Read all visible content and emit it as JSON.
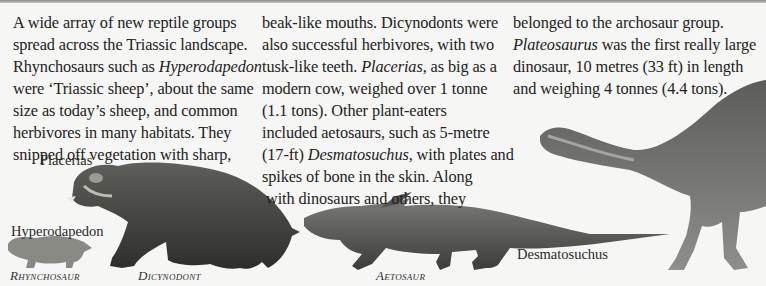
{
  "columns": [
    {
      "lines": [
        {
          "t": "A wide array of new reptile groups"
        },
        {
          "t": "spread across the Triassic landscape."
        },
        {
          "t": "Rhynchosaurs such as ",
          "i": "Hyperodapedon"
        },
        {
          "t": "were ‘Triassic sheep’, about the same"
        },
        {
          "t": "size as today’s sheep, and common"
        },
        {
          "t": "herbivores in many habitats. They"
        },
        {
          "t": "snipped off vegetation with sharp,"
        }
      ]
    },
    {
      "lines": [
        {
          "t": "beak-like mouths. Dicynodonts were"
        },
        {
          "t": "also successful herbivores, with two"
        },
        {
          "t": "tusk-like teeth. ",
          "i": "Placerias",
          "after": ", as big as a"
        },
        {
          "t": "modern cow, weighed over 1 tonne"
        },
        {
          "t": "(1.1 tons). Other plant-eaters"
        },
        {
          "t": "included aetosaurs, such as 5-metre"
        },
        {
          "t": "(17-ft) ",
          "i": "Desmatosuchus",
          "after": ", with plates and"
        },
        {
          "t": "spikes of bone in the skin. Along"
        },
        {
          "t": "with dinosaurs and others, they"
        }
      ]
    },
    {
      "lines": [
        {
          "t": "belonged to the archosaur group."
        },
        {
          "t": "",
          "i": "Plateosaurus",
          "after": " was the first really large"
        },
        {
          "t": "dinosaur, 10 metres (33 ft) in length"
        },
        {
          "t": "and weighing 4 tonnes (4.4 tons)."
        }
      ]
    }
  ],
  "captions": {
    "placerias": "Placerias",
    "hyperodapedon": "Hyperodapedon",
    "desmatosuchus": "Desmatosuchus",
    "rhynchosaur": "Rhynchosaur",
    "dicynodont": "Dicynodont",
    "aetosaur": "Aetosaur"
  },
  "illustrations": [
    {
      "name": "Placerias",
      "group": "Dicynodont"
    },
    {
      "name": "Hyperodapedon",
      "group": "Rhynchosaur"
    },
    {
      "name": "Desmatosuchus",
      "group": "Aetosaur"
    },
    {
      "name": "Plateosaurus"
    }
  ]
}
